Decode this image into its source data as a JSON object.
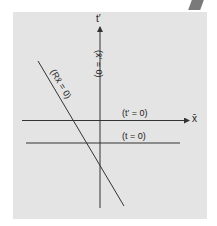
{
  "diagram": {
    "axes": {
      "vertical_label": "t′",
      "horizontal_label": "x̄"
    },
    "lines": [
      {
        "id": "t_prime_zero",
        "label": "(t′ = 0)",
        "orientation": "horizontal",
        "role": "x-bar axis"
      },
      {
        "id": "t_zero",
        "label": "(t = 0)",
        "orientation": "horizontal"
      },
      {
        "id": "x_prime_zero",
        "label": "(x̄′ = 0)",
        "orientation": "vertical",
        "role": "t-prime axis"
      },
      {
        "id": "R_x_zero",
        "label": "(Rx̄ = 0)",
        "orientation": "diagonal"
      }
    ],
    "colors": {
      "panel": "#e4e4e4",
      "lines": "#333333",
      "text": "#222222"
    }
  }
}
